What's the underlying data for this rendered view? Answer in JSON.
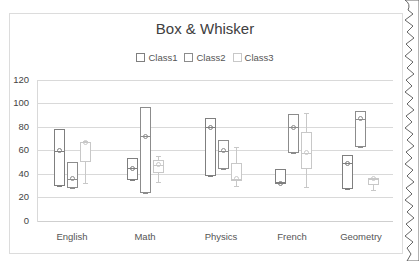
{
  "chart_data": {
    "type": "box",
    "title": "Box & Whisker",
    "xlabel": "",
    "ylabel": "",
    "ylim": [
      0,
      120
    ],
    "yticks": [
      0,
      20,
      40,
      60,
      80,
      100,
      120
    ],
    "grid": true,
    "legend_position": "top",
    "categories": [
      "English",
      "Math",
      "Physics",
      "French",
      "Geometry"
    ],
    "series": [
      {
        "name": "Class1",
        "color": "#7f7f7f",
        "boxes": [
          {
            "category": "English",
            "min": 30,
            "q1": 30,
            "median": 60,
            "q3": 78,
            "max": 78,
            "mean": 60
          },
          {
            "category": "Math",
            "min": 35,
            "q1": 35,
            "median": 45,
            "q3": 54,
            "max": 54,
            "mean": 45
          },
          {
            "category": "Physics",
            "min": 38,
            "q1": 38,
            "median": 80,
            "q3": 88,
            "max": 88,
            "mean": 80
          },
          {
            "category": "French",
            "min": 32,
            "q1": 32,
            "median": 32,
            "q3": 44,
            "max": 44,
            "mean": 32
          },
          {
            "category": "Geometry",
            "min": 27,
            "q1": 27,
            "median": 49,
            "q3": 56,
            "max": 56,
            "mean": 49
          }
        ]
      },
      {
        "name": "Class2",
        "color": "#8c8c8c",
        "boxes": [
          {
            "category": "English",
            "min": 28,
            "q1": 28,
            "median": 36,
            "q3": 50,
            "max": 50,
            "mean": 36
          },
          {
            "category": "Math",
            "min": 24,
            "q1": 24,
            "median": 72,
            "q3": 97,
            "max": 97,
            "mean": 72
          },
          {
            "category": "Physics",
            "min": 44,
            "q1": 44,
            "median": 60,
            "q3": 69,
            "max": 69,
            "mean": 60
          },
          {
            "category": "French",
            "min": 58,
            "q1": 58,
            "median": 80,
            "q3": 91,
            "max": 91,
            "mean": 80
          },
          {
            "category": "Geometry",
            "min": 63,
            "q1": 63,
            "median": 87,
            "q3": 94,
            "max": 94,
            "mean": 87
          }
        ]
      },
      {
        "name": "Class3",
        "color": "#c8c8c8",
        "boxes": [
          {
            "category": "English",
            "min": 32,
            "q1": 50,
            "median": 67,
            "q3": 67,
            "max": 68,
            "mean": 67
          },
          {
            "category": "Math",
            "min": 33,
            "q1": 41,
            "median": 48,
            "q3": 52,
            "max": 55,
            "mean": 48
          },
          {
            "category": "Physics",
            "min": 30,
            "q1": 34,
            "median": 36,
            "q3": 49,
            "max": 63,
            "mean": 36
          },
          {
            "category": "French",
            "min": 29,
            "q1": 44,
            "median": 58,
            "q3": 76,
            "max": 92,
            "mean": 58
          },
          {
            "category": "Geometry",
            "min": 26,
            "q1": 31,
            "median": 36,
            "q3": 37,
            "max": 37,
            "mean": 36
          }
        ]
      }
    ]
  },
  "title": "Box & Whisker",
  "legend": {
    "items": [
      {
        "label": "Class1",
        "color": "#7f7f7f"
      },
      {
        "label": "Class2",
        "color": "#8c8c8c"
      },
      {
        "label": "Class3",
        "color": "#c8c8c8"
      }
    ]
  },
  "y_axis": {
    "ticks": [
      "120",
      "100",
      "80",
      "60",
      "40",
      "20",
      "0"
    ]
  },
  "x_axis": {
    "labels": [
      "English",
      "Math",
      "Physics",
      "French",
      "Geometry"
    ]
  }
}
